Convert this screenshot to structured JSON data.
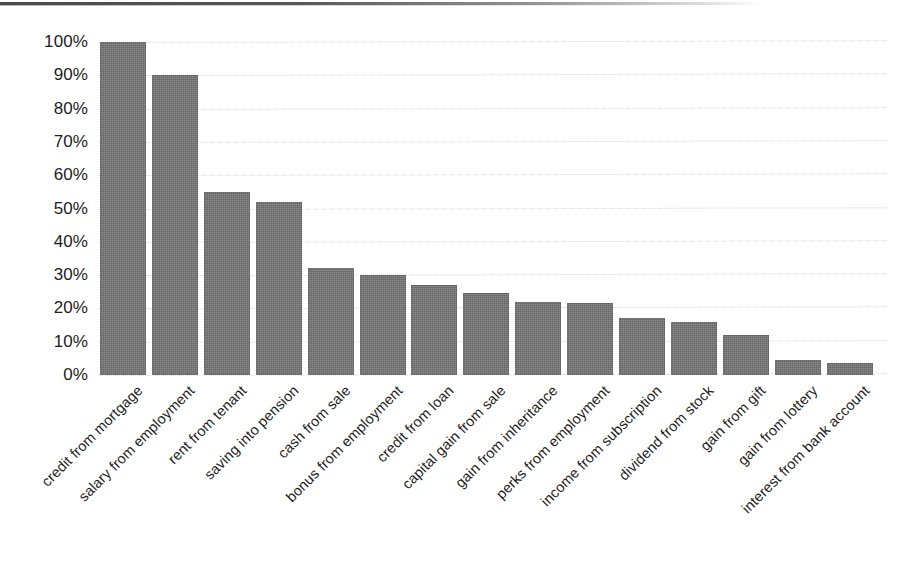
{
  "chart_data": {
    "type": "bar",
    "title": "",
    "xlabel": "",
    "ylabel": "",
    "ylim": [
      0,
      100
    ],
    "yunit": "%",
    "grid": true,
    "legend": "none",
    "orientation": "vertical",
    "bar_color": "#6f6f6f",
    "gridline_color": "#e6e6e6",
    "text_color": "#1d1d1d",
    "background": "#ffffff",
    "categories": [
      "credit from mortgage",
      "salary from employment",
      "rent from tenant",
      "saving into pension",
      "cash from sale",
      "bonus from employment",
      "credit from loan",
      "capital gain from sale",
      "gain from inheritance",
      "perks from employment",
      "income from subscription",
      "dividend from stock",
      "gain from gift",
      "gain from lottery",
      "interest from bank account"
    ],
    "values": [
      100,
      90,
      55,
      52,
      32,
      30,
      27,
      24.5,
      22,
      21.5,
      17,
      16,
      12,
      4.5,
      3.5
    ],
    "ytick_labels": [
      "100%",
      "90%",
      "80%",
      "70%",
      "60%",
      "50%",
      "40%",
      "30%",
      "20%",
      "10%",
      "0%"
    ],
    "ytick_values": [
      100,
      90,
      80,
      70,
      60,
      50,
      40,
      30,
      20,
      10,
      0
    ]
  }
}
